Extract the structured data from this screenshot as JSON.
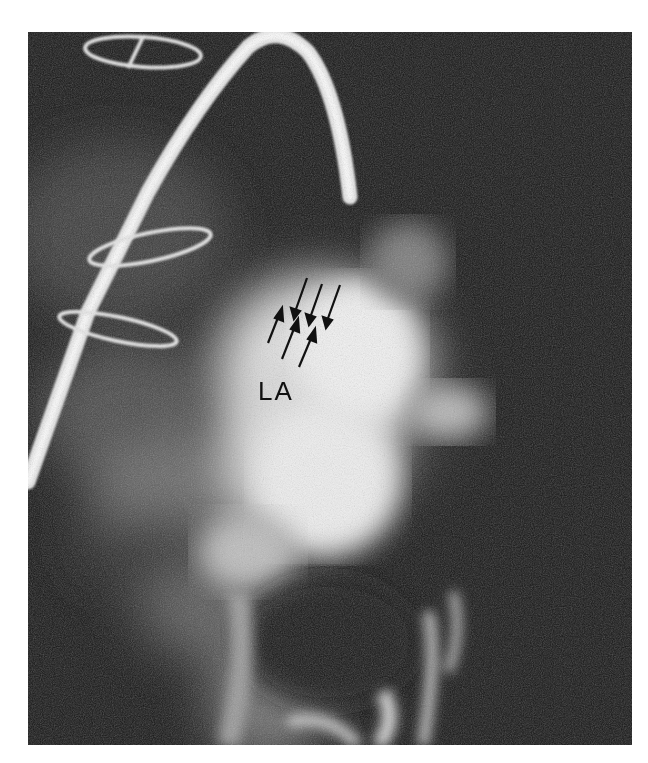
{
  "figure": {
    "type": "angiographic radiograph",
    "background_color": "#ffffff",
    "image_tones": {
      "dark": "#141414",
      "bright": "#f2f2f2"
    },
    "annotations": {
      "chamber_label": "LA",
      "arrow_count": 6,
      "arrows_pointing_down": 3,
      "arrows_pointing_up": 3
    },
    "features": [
      "catheter",
      "coil-top",
      "coil-middle",
      "coil-lower",
      "contrast-opacified-left-atrium"
    ]
  }
}
